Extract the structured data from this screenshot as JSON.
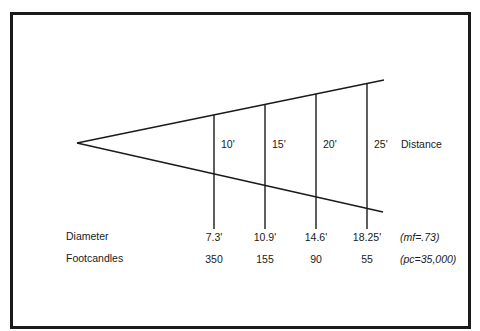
{
  "diagram": {
    "distance_label": "Distance",
    "distances": [
      "10'",
      "15'",
      "20'",
      "25'"
    ],
    "rows": [
      {
        "label": "Diameter",
        "values": [
          "7.3'",
          "10.9'",
          "14.6'",
          "18.25'"
        ],
        "note": "(mf=.73)"
      },
      {
        "label": "Footcandles",
        "values": [
          "350",
          "155",
          "90",
          "55"
        ],
        "note": "(pc=35,000)"
      }
    ],
    "colors": {
      "line": "#1a1a1a",
      "background": "#ffffff"
    }
  }
}
